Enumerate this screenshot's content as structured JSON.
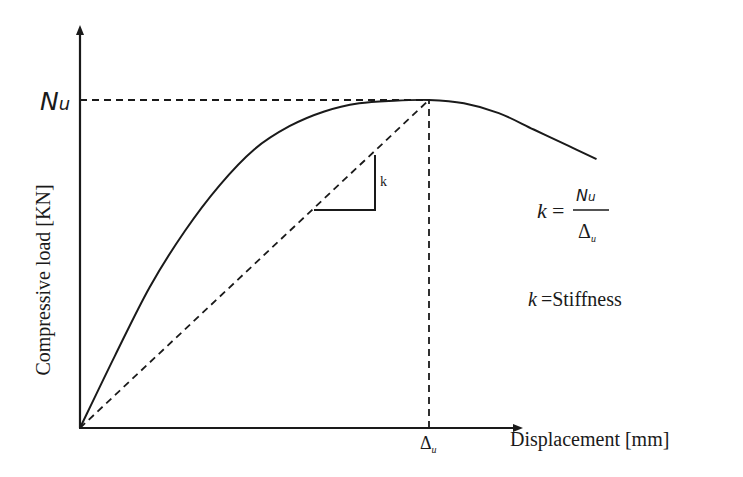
{
  "chart_data": {
    "type": "line",
    "title": "",
    "xlabel": "Displacement [mm]",
    "ylabel": "Compressive load [KN]",
    "y_marker_label": "Nu",
    "x_marker_label": "Δu",
    "x_marker_label_main": "Δ",
    "x_marker_label_sub": "u",
    "y_marker_label_main": "N",
    "y_marker_label_sub": "u",
    "normalized_axes": true,
    "xlim": [
      0,
      1.0
    ],
    "ylim": [
      0,
      1.0
    ],
    "series": [
      {
        "name": "load-displacement curve",
        "style": "solid",
        "x": [
          0,
          0.1,
          0.2,
          0.3,
          0.4,
          0.5,
          0.6,
          0.7,
          0.8,
          0.9,
          1.0,
          1.1,
          1.2,
          1.3,
          1.4,
          1.48
        ],
        "y": [
          0,
          0.22,
          0.43,
          0.6,
          0.74,
          0.85,
          0.92,
          0.965,
          0.99,
          0.998,
          1.0,
          0.99,
          0.96,
          0.91,
          0.86,
          0.82
        ]
      },
      {
        "name": "secant stiffness line",
        "style": "dashed",
        "x": [
          0,
          1.0
        ],
        "y": [
          0,
          1.0
        ]
      }
    ],
    "guides": [
      {
        "name": "Nu-level",
        "style": "dashed",
        "from": [
          0,
          1.0
        ],
        "to": [
          1.0,
          1.0
        ]
      },
      {
        "name": "Δu-level",
        "style": "dashed",
        "from": [
          1.0,
          0
        ],
        "to": [
          1.0,
          1.0
        ]
      }
    ],
    "annotations": {
      "slope_label": "k",
      "formula": {
        "lhs": "k",
        "eq": "=",
        "numerator": "Nu",
        "numerator_main": "N",
        "numerator_sub": "u",
        "denominator_main": "Δ",
        "denominator_sub": "u"
      },
      "definition": {
        "symbol": "k",
        "text": "=Stiffness"
      }
    }
  }
}
